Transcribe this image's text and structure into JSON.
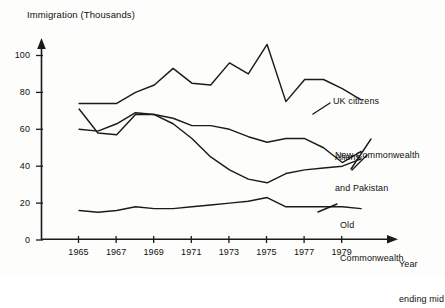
{
  "chart_data": {
    "type": "line",
    "title": "Immigration (Thousands)",
    "xlabel": "Year ending mid",
    "ylabel": "Immigration (Thousands)",
    "x": [
      1965,
      1966,
      1967,
      1968,
      1969,
      1970,
      1971,
      1972,
      1973,
      1974,
      1975,
      1976,
      1977,
      1978,
      1979,
      1980
    ],
    "xlim": [
      1964.3,
      1980.5
    ],
    "ylim": [
      0,
      112
    ],
    "xticks": [
      1965,
      1967,
      1969,
      1971,
      1973,
      1975,
      1977,
      1979
    ],
    "xtick_labels": [
      "1965",
      "1967",
      "1969",
      "1971",
      "1973",
      "1975",
      "1977",
      "1979"
    ],
    "yticks": [
      0,
      20,
      40,
      60,
      80,
      100
    ],
    "ytick_labels": [
      "0",
      "20",
      "40",
      "60",
      "80",
      "100"
    ],
    "grid": false,
    "legend_position": "right-inline-annotations",
    "line_color": "#1b1b1b",
    "axis_color": "#1b1b1b",
    "background": "#fdfdfc",
    "series": [
      {
        "name": "UK citizens",
        "label": "UK citizens",
        "label_lines": [
          "UK citizens"
        ],
        "values": [
          74,
          74,
          74,
          80,
          84,
          93,
          85,
          84,
          96,
          90,
          106,
          75,
          87,
          87,
          82,
          76
        ]
      },
      {
        "name": "New Commonwealth and Pakistan",
        "label": "New Commonwealth and Pakistan",
        "label_lines": [
          "New Commonwealth",
          "and Pakistan"
        ],
        "values": [
          60,
          59,
          63,
          69,
          68,
          66,
          62,
          62,
          60,
          56,
          53,
          55,
          55,
          50,
          42,
          48
        ]
      },
      {
        "name": "Aliens",
        "label": "Aliens",
        "label_lines": [
          "Aliens"
        ],
        "values": [
          71,
          58,
          57,
          68,
          68,
          63,
          55,
          45,
          38,
          33,
          31,
          36,
          38,
          39,
          40,
          44
        ]
      },
      {
        "name": "Old Commonwealth",
        "label": "Old Commonwealth",
        "label_lines": [
          "Old",
          "Commonwealth"
        ],
        "values": [
          16,
          15,
          16,
          18,
          17,
          17,
          18,
          19,
          20,
          21,
          23,
          18,
          18,
          18,
          18,
          17
        ]
      }
    ],
    "annotations": [
      {
        "text": "UK citizens",
        "series": "UK citizens"
      },
      {
        "text": "New Commonwealth and Pakistan",
        "series": "New Commonwealth and Pakistan"
      },
      {
        "text": "Aliens",
        "series": "Aliens"
      },
      {
        "text": "Old Commonwealth",
        "series": "Old Commonwealth"
      }
    ]
  },
  "labels": {
    "title": "Immigration (Thousands)",
    "xaxis_line1": "Year",
    "xaxis_line2": "ending mid",
    "uk_citizens": "UK citizens",
    "ncp_line1": "New Commonwealth",
    "ncp_line2": "and Pakistan",
    "aliens": "Aliens",
    "oldcw_line1": "Old",
    "oldcw_line2": "Commonwealth",
    "ytick_0": "0",
    "ytick_20": "20",
    "ytick_40": "40",
    "ytick_60": "60",
    "ytick_80": "80",
    "ytick_100": "100",
    "xtick_1965": "1965",
    "xtick_1967": "1967",
    "xtick_1969": "1969",
    "xtick_1971": "1971",
    "xtick_1973": "1973",
    "xtick_1975": "1975",
    "xtick_1977": "1977",
    "xtick_1979": "1979"
  }
}
